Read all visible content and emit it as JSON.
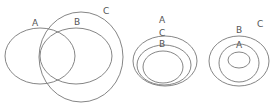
{
  "diagrams": [
    {
      "id": "overlap",
      "description": "A and B overlap; C overlaps both",
      "labels": {
        "a": "A",
        "b": "B",
        "c": "C"
      }
    },
    {
      "id": "nested-acb",
      "description": "A contains C which contains B",
      "labels": {
        "a": "A",
        "c": "C",
        "b": "B"
      }
    },
    {
      "id": "nested-cba",
      "description": "C contains B which contains A",
      "labels": {
        "c": "C",
        "b": "B",
        "a": "A"
      }
    }
  ],
  "colors": {
    "stroke": "#777777",
    "label": "#555555",
    "background": "#ffffff"
  }
}
